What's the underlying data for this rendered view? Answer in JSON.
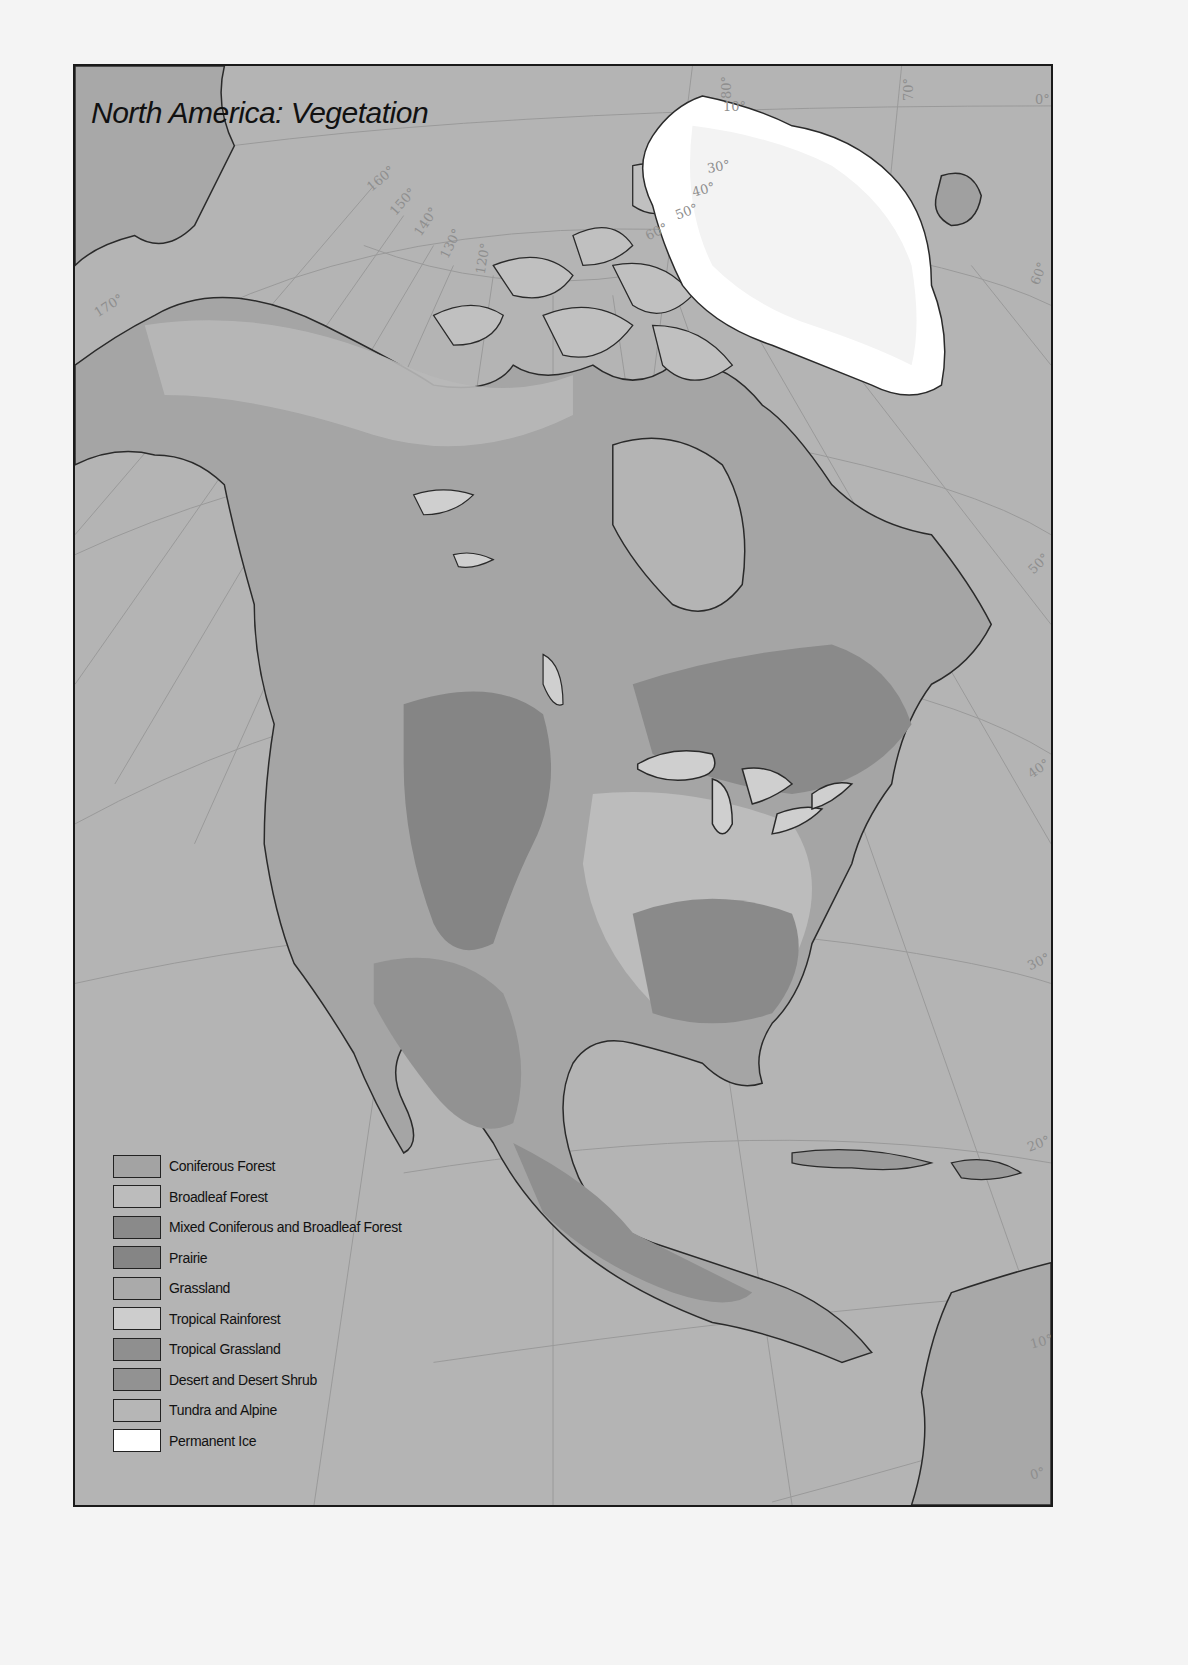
{
  "map": {
    "title": "North America: Vegetation",
    "graticule": {
      "longitude_labels": [
        "170°",
        "160°",
        "150°",
        "140°",
        "130°",
        "120°",
        "80°",
        "70°",
        "0°"
      ],
      "greenland_latitude_labels": [
        "10°",
        "30°",
        "40°",
        "50°",
        "60°"
      ],
      "right_edge_latitude_labels": [
        "60°",
        "50°",
        "40°",
        "30°",
        "20°",
        "10°",
        "0°"
      ]
    },
    "legend": {
      "items": [
        {
          "label": "Coniferous Forest",
          "color": "#a3a3a3"
        },
        {
          "label": "Broadleaf Forest",
          "color": "#bcbcbc"
        },
        {
          "label": "Mixed Coniferous and Broadleaf Forest",
          "color": "#8a8a8a"
        },
        {
          "label": "Prairie",
          "color": "#858585"
        },
        {
          "label": "Grassland",
          "color": "#aaaaaa"
        },
        {
          "label": "Tropical Rainforest",
          "color": "#cdcdcd"
        },
        {
          "label": "Tropical Grassland",
          "color": "#8f8f8f"
        },
        {
          "label": "Desert and Desert Shrub",
          "color": "#929292"
        },
        {
          "label": "Tundra and Alpine",
          "color": "#b6b6b6"
        },
        {
          "label": "Permanent Ice",
          "color": "#ffffff"
        }
      ]
    },
    "colors": {
      "ocean": "#b4b4b4",
      "frame": "#1a1a1a",
      "coastline": "#2a2a2a",
      "graticule": "#9a9a9a"
    }
  }
}
